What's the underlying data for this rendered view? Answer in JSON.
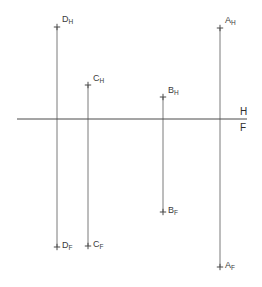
{
  "drawing": {
    "title": "Orthographic projection — point locations relative to H/F reference line",
    "width": 262,
    "height": 287,
    "background_color": "#ffffff",
    "line_color": "#6b6b6b",
    "reference_line_color": "#4a4a4a",
    "tick_color": "#4a4a4a",
    "label_color": "#3b3b3b",
    "reference_line": {
      "name": "H/F fold line",
      "y": 119,
      "x_start": 17,
      "x_end": 247,
      "upper_label": "H",
      "lower_label": "F",
      "label_x": 240,
      "upper_label_y": 107,
      "lower_label_y": 123
    },
    "points": [
      {
        "id": "D",
        "x": 57,
        "top": {
          "label": "D",
          "subscript": "H",
          "y": 27,
          "view": "horizontal",
          "label_dx": 5,
          "label_dy": -12
        },
        "bottom": {
          "label": "D",
          "subscript": "F",
          "y": 247,
          "view": "frontal",
          "label_dx": 5,
          "label_dy": -6
        }
      },
      {
        "id": "C",
        "x": 88,
        "top": {
          "label": "C",
          "subscript": "H",
          "y": 85,
          "view": "horizontal",
          "label_dx": 5,
          "label_dy": -11
        },
        "bottom": {
          "label": "C",
          "subscript": "F",
          "y": 246,
          "view": "frontal",
          "label_dx": 5,
          "label_dy": -6
        }
      },
      {
        "id": "B",
        "x": 163,
        "top": {
          "label": "B",
          "subscript": "H",
          "y": 97,
          "view": "horizontal",
          "label_dx": 5,
          "label_dy": -11
        },
        "bottom": {
          "label": "B",
          "subscript": "F",
          "y": 212,
          "view": "frontal",
          "label_dx": 5,
          "label_dy": -6
        }
      },
      {
        "id": "A",
        "x": 220,
        "top": {
          "label": "A",
          "subscript": "H",
          "y": 28,
          "view": "horizontal",
          "label_dx": 5,
          "label_dy": -12
        },
        "bottom": {
          "label": "A",
          "subscript": "F",
          "y": 267,
          "view": "frontal",
          "label_dx": 5,
          "label_dy": -6
        }
      }
    ]
  }
}
